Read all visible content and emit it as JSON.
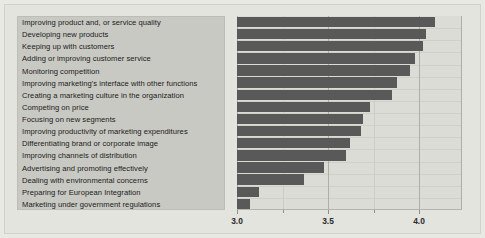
{
  "chart_data": {
    "type": "bar",
    "orientation": "horizontal",
    "title": "",
    "xlabel": "",
    "ylabel": "",
    "xlim": [
      3.0,
      4.236
    ],
    "grid": true,
    "legend": false,
    "xticks": [
      3.0,
      3.5,
      4.0
    ],
    "xtick_labels": [
      "3.0",
      "3.5",
      "4.0"
    ],
    "bar_color": "#595959",
    "panel_color": "#c9c9c3",
    "plot_bg_color": "#dcdcd6",
    "categories": [
      "Improving product and, or service quality",
      "Developing new products",
      "Keeping up with customers",
      "Adding or improving customer service",
      "Monitoring competition",
      "Improving marketing's interface with other functions",
      "Creating a marketing culture in the organization",
      "Competing on price",
      "Focusing on new segments",
      "Improving productivity of marketing expenditures",
      "Differentiating brand or corporate image",
      "Improving channels of distribution",
      "Advertising and promoting effectively",
      "Dealing with environmental concerns",
      "Preparing for European Integration",
      "Marketing under government regulations"
    ],
    "values": [
      4.09,
      4.04,
      4.02,
      3.98,
      3.95,
      3.88,
      3.85,
      3.73,
      3.69,
      3.68,
      3.62,
      3.6,
      3.48,
      3.37,
      3.12,
      3.07
    ]
  }
}
